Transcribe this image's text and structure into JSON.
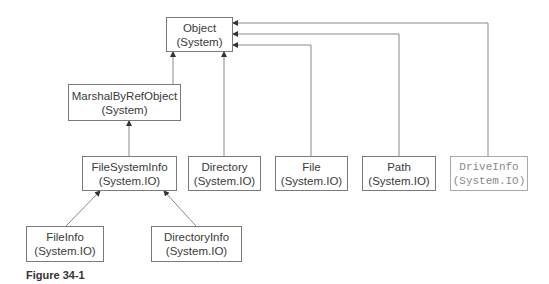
{
  "diagram": {
    "nodes": [
      {
        "id": "object",
        "name": "Object",
        "namespace": "(System)"
      },
      {
        "id": "marshal",
        "name": "MarshalByRefObject",
        "namespace": "(System)"
      },
      {
        "id": "filesysteminfo",
        "name": "FileSystemInfo",
        "namespace": "(System.IO)"
      },
      {
        "id": "directory",
        "name": "Directory",
        "namespace": "(System.IO)"
      },
      {
        "id": "file",
        "name": "File",
        "namespace": "(System.IO)"
      },
      {
        "id": "path",
        "name": "Path",
        "namespace": "(System.IO)"
      },
      {
        "id": "driveinfo",
        "name": "DriveInfo",
        "namespace": "(System.IO)"
      },
      {
        "id": "fileinfo",
        "name": "FileInfo",
        "namespace": "(System.IO)"
      },
      {
        "id": "directoryinfo",
        "name": "DirectoryInfo",
        "namespace": "(System.IO)"
      }
    ],
    "edges": [
      {
        "from": "marshal",
        "to": "object"
      },
      {
        "from": "directory",
        "to": "object"
      },
      {
        "from": "file",
        "to": "object"
      },
      {
        "from": "path",
        "to": "object"
      },
      {
        "from": "driveinfo",
        "to": "object"
      },
      {
        "from": "filesysteminfo",
        "to": "marshal"
      },
      {
        "from": "fileinfo",
        "to": "filesysteminfo"
      },
      {
        "from": "directoryinfo",
        "to": "filesysteminfo"
      }
    ],
    "caption": "Figure 34-1"
  }
}
